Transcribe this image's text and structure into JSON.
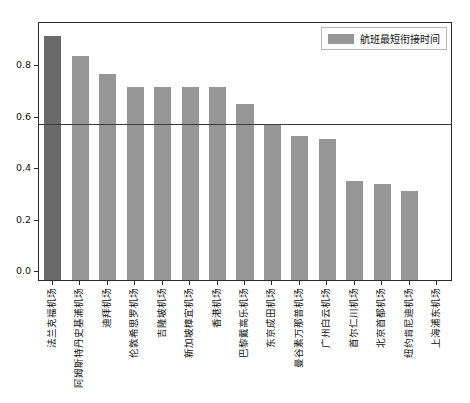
{
  "chart_data": {
    "type": "bar",
    "title": "",
    "xlabel": "",
    "ylabel": "",
    "ylim": [
      0.0,
      1.0
    ],
    "yticks": [
      "0.0",
      "0.2",
      "0.4",
      "0.6",
      "0.8"
    ],
    "ytick_values": [
      0.0,
      0.2,
      0.4,
      0.6,
      0.8
    ],
    "grid": false,
    "legend_position": "upper right",
    "legend": [
      "航班最短衔接时间"
    ],
    "categories": [
      "法兰克福机场",
      "阿姆斯特丹史基浦机场",
      "迪拜机场",
      "伦敦希思罗机场",
      "吉隆坡机场",
      "新加坡樟宜机场",
      "香港机场",
      "巴黎戴高乐机场",
      "东京成田机场",
      "曼谷素万那普机场",
      "广州白云机场",
      "首尔仁川机场",
      "北京首都机场",
      "纽约肯尼迪机场",
      "上海浦东机场"
    ],
    "values": [
      0.95,
      0.87,
      0.8,
      0.75,
      0.75,
      0.75,
      0.75,
      0.685,
      0.605,
      0.56,
      0.55,
      0.385,
      0.375,
      0.345,
      0.0
    ],
    "series": [
      {
        "name": "航班最短衔接时间",
        "values": [
          0.95,
          0.87,
          0.8,
          0.75,
          0.75,
          0.75,
          0.75,
          0.685,
          0.605,
          0.56,
          0.55,
          0.385,
          0.375,
          0.345,
          0.0
        ]
      }
    ],
    "highlight_index": 0,
    "annotations": [
      {
        "type": "hline",
        "y": 0.605,
        "label": ""
      }
    ],
    "colors": {
      "bar": "#969696",
      "bar_highlight": "#6a6a6a",
      "axis": "#2b2b2b",
      "hline": "#3a3a3a",
      "background": "#ffffff",
      "text": "#111111"
    }
  }
}
